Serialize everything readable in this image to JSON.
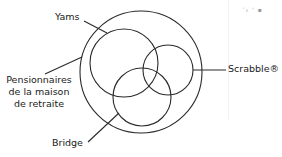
{
  "diagram": {
    "type": "venn",
    "stroke_color": "#2a2a2a",
    "universe": {
      "label_lines": [
        "Pensionnaires",
        "de la maison",
        "de retraite"
      ]
    },
    "sets": [
      {
        "id": "yams",
        "label": "Yams"
      },
      {
        "id": "scrabble",
        "label": "Scrabble®"
      },
      {
        "id": "bridge",
        "label": "Bridge"
      }
    ],
    "artifact_text": "ʿ₅ ' ▪"
  }
}
